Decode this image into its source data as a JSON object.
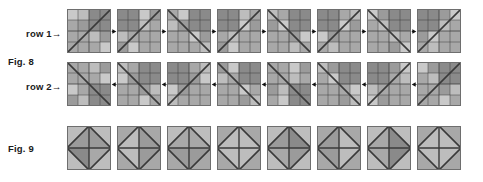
{
  "figure": {
    "background_color": "#ffffff",
    "ink_color": "#1a1a1a",
    "width": 483,
    "height": 182
  },
  "labels": {
    "row1": "row 1→",
    "fig8": "Fig. 8",
    "row2": "row 2→",
    "fig9": "Fig. 9"
  },
  "palette": {
    "light": "#c9c9c9",
    "light2": "#bdbdbd",
    "mid": "#a8a8a8",
    "mid2": "#9b9b9b",
    "dark": "#8a8a8a",
    "dark2": "#7d7d7d",
    "line": "#3a3a3a",
    "tile_border": "#6e6e6e",
    "arrow": "#111111"
  },
  "fig8": {
    "caption": "Fig. 8",
    "tile_size": 44,
    "tile_pitch": 50,
    "rows": [
      {
        "name": "row 1",
        "label": "row 1→",
        "arrow_direction": "right",
        "arrow_glyph": "▶",
        "tiles": [
          {
            "diagonal": "anti",
            "quads": [
              [
                "light",
                "mid"
              ],
              [
                "mid2",
                "light2"
              ]
            ],
            "q_tl": [
              "light",
              "light2",
              "mid",
              "mid2"
            ],
            "q_tr": [
              "dark",
              "dark",
              "dark",
              "dark"
            ],
            "q_bl": [
              "mid",
              "mid",
              "mid",
              "mid"
            ],
            "q_br": [
              "light2",
              "mid2",
              "mid",
              "light"
            ]
          },
          {
            "diagonal": "anti",
            "quads": [
              [
                "mid",
                "light"
              ],
              [
                "light2",
                "mid2"
              ]
            ],
            "q_tl": [
              "dark",
              "dark",
              "dark",
              "dark"
            ],
            "q_tr": [
              "light",
              "mid2",
              "light2",
              "mid"
            ],
            "q_bl": [
              "light2",
              "mid",
              "mid2",
              "light"
            ],
            "q_br": [
              "mid",
              "mid",
              "mid",
              "mid"
            ]
          },
          {
            "diagonal": "main",
            "quads": [
              [
                "light2",
                "mid"
              ],
              [
                "mid",
                "light"
              ]
            ],
            "q_tl": [
              "mid",
              "light",
              "light2",
              "mid2"
            ],
            "q_tr": [
              "dark",
              "dark",
              "dark",
              "dark"
            ],
            "q_bl": [
              "mid",
              "mid",
              "mid",
              "mid"
            ],
            "q_br": [
              "light",
              "mid2",
              "mid",
              "light2"
            ]
          },
          {
            "diagonal": "anti",
            "quads": [
              [
                "mid2",
                "light2"
              ],
              [
                "light",
                "mid"
              ]
            ],
            "q_tl": [
              "dark",
              "dark",
              "dark",
              "dark"
            ],
            "q_tr": [
              "light2",
              "mid",
              "light",
              "mid2"
            ],
            "q_bl": [
              "mid",
              "light2",
              "mid2",
              "light"
            ],
            "q_br": [
              "mid",
              "mid",
              "mid",
              "mid"
            ]
          },
          {
            "diagonal": "main",
            "quads": [
              [
                "light",
                "mid2"
              ],
              [
                "mid2",
                "light2"
              ]
            ],
            "q_tl": [
              "light2",
              "mid",
              "mid2",
              "light"
            ],
            "q_tr": [
              "dark",
              "dark",
              "dark",
              "dark"
            ],
            "q_bl": [
              "mid",
              "mid",
              "mid",
              "mid"
            ],
            "q_br": [
              "mid2",
              "light",
              "light2",
              "mid"
            ]
          },
          {
            "diagonal": "anti",
            "quads": [
              [
                "mid",
                "light"
              ],
              [
                "light2",
                "mid"
              ]
            ],
            "q_tl": [
              "dark",
              "dark",
              "dark",
              "dark"
            ],
            "q_tr": [
              "mid",
              "light2",
              "light",
              "mid2"
            ],
            "q_bl": [
              "light",
              "mid2",
              "mid",
              "light2"
            ],
            "q_br": [
              "mid",
              "mid",
              "mid",
              "mid"
            ]
          },
          {
            "diagonal": "main",
            "quads": [
              [
                "mid2",
                "light2"
              ],
              [
                "light",
                "mid"
              ]
            ],
            "q_tl": [
              "light",
              "mid2",
              "mid",
              "light2"
            ],
            "q_tr": [
              "dark",
              "dark",
              "dark",
              "dark"
            ],
            "q_bl": [
              "mid",
              "mid",
              "mid",
              "mid"
            ],
            "q_br": [
              "light2",
              "mid",
              "mid2",
              "light"
            ]
          },
          {
            "diagonal": "anti",
            "quads": [
              [
                "light2",
                "mid"
              ],
              [
                "mid2",
                "light"
              ]
            ],
            "q_tl": [
              "dark",
              "dark",
              "dark",
              "dark"
            ],
            "q_tr": [
              "mid2",
              "light",
              "light2",
              "mid"
            ],
            "q_bl": [
              "mid2",
              "light",
              "mid",
              "light2"
            ],
            "q_br": [
              "mid",
              "mid",
              "mid",
              "mid"
            ]
          }
        ]
      },
      {
        "name": "row 2",
        "label": "row 2→",
        "arrow_direction": "left",
        "arrow_glyph": "◀",
        "tiles": [
          {
            "diagonal": "main",
            "q_tl": [
              "mid",
              "mid",
              "mid",
              "mid"
            ],
            "q_tr": [
              "light2",
              "mid2",
              "mid",
              "light"
            ],
            "q_bl": [
              "light",
              "mid",
              "mid2",
              "light2"
            ],
            "q_br": [
              "dark",
              "dark",
              "dark",
              "dark"
            ]
          },
          {
            "diagonal": "main",
            "q_tl": [
              "light2",
              "mid",
              "light",
              "mid2"
            ],
            "q_tr": [
              "dark",
              "dark",
              "dark",
              "dark"
            ],
            "q_bl": [
              "mid",
              "mid",
              "mid",
              "mid"
            ],
            "q_br": [
              "mid2",
              "light2",
              "light",
              "mid"
            ]
          },
          {
            "diagonal": "anti",
            "q_tl": [
              "dark",
              "dark",
              "dark",
              "dark"
            ],
            "q_tr": [
              "mid",
              "light2",
              "mid2",
              "light"
            ],
            "q_bl": [
              "light",
              "mid2",
              "light2",
              "mid"
            ],
            "q_br": [
              "mid",
              "mid",
              "mid",
              "mid"
            ]
          },
          {
            "diagonal": "main",
            "q_tl": [
              "mid2",
              "light",
              "light2",
              "mid"
            ],
            "q_tr": [
              "dark",
              "dark",
              "dark",
              "dark"
            ],
            "q_bl": [
              "mid",
              "mid",
              "mid",
              "mid"
            ],
            "q_br": [
              "light",
              "mid",
              "mid2",
              "light2"
            ]
          },
          {
            "diagonal": "main",
            "q_tl": [
              "mid",
              "mid",
              "mid",
              "mid"
            ],
            "q_tr": [
              "light",
              "mid2",
              "light2",
              "mid"
            ],
            "q_bl": [
              "mid2",
              "light2",
              "mid",
              "light"
            ],
            "q_br": [
              "dark",
              "dark",
              "dark",
              "dark"
            ]
          },
          {
            "diagonal": "main",
            "q_tl": [
              "light2",
              "mid2",
              "mid",
              "light"
            ],
            "q_tr": [
              "dark",
              "dark",
              "dark",
              "dark"
            ],
            "q_bl": [
              "mid",
              "mid",
              "mid",
              "mid"
            ],
            "q_br": [
              "mid",
              "light",
              "mid2",
              "light2"
            ]
          },
          {
            "diagonal": "anti",
            "q_tl": [
              "dark",
              "dark",
              "dark",
              "dark"
            ],
            "q_tr": [
              "mid2",
              "light",
              "mid",
              "light2"
            ],
            "q_bl": [
              "light2",
              "mid",
              "light",
              "mid2"
            ],
            "q_br": [
              "mid",
              "mid",
              "mid",
              "mid"
            ]
          },
          {
            "diagonal": "anti",
            "q_tl": [
              "light",
              "mid2",
              "mid",
              "light2"
            ],
            "q_tr": [
              "dark",
              "dark",
              "dark",
              "dark"
            ],
            "q_bl": [
              "mid",
              "mid",
              "mid",
              "mid"
            ],
            "q_br": [
              "mid2",
              "light2",
              "light",
              "mid"
            ]
          }
        ]
      }
    ]
  },
  "fig9": {
    "caption": "Fig. 9",
    "tile_size": 44,
    "tile_pitch": 50,
    "tiles": [
      {
        "corners": [
          "light2",
          "light2",
          "light2",
          "light2"
        ],
        "diamond": [
          "mid2",
          "mid",
          "dark",
          "mid2"
        ]
      },
      {
        "corners": [
          "mid",
          "mid",
          "mid",
          "mid"
        ],
        "diamond": [
          "mid2",
          "mid2",
          "light2",
          "light2"
        ]
      },
      {
        "corners": [
          "light2",
          "light2",
          "mid",
          "mid"
        ],
        "diamond": [
          "mid",
          "mid2",
          "mid2",
          "mid"
        ]
      },
      {
        "corners": [
          "mid",
          "mid",
          "mid",
          "mid"
        ],
        "diamond": [
          "light2",
          "light2",
          "light2",
          "light2"
        ]
      },
      {
        "corners": [
          "light2",
          "light2",
          "light2",
          "light2"
        ],
        "diamond": [
          "dark",
          "mid2",
          "mid",
          "mid2"
        ]
      },
      {
        "corners": [
          "mid",
          "mid",
          "mid",
          "mid"
        ],
        "diamond": [
          "light2",
          "light2",
          "mid2",
          "mid2"
        ]
      },
      {
        "corners": [
          "light2",
          "light2",
          "light2",
          "light2"
        ],
        "diamond": [
          "dark",
          "dark",
          "mid",
          "mid"
        ]
      },
      {
        "corners": [
          "mid",
          "mid",
          "mid",
          "mid"
        ],
        "diamond": [
          "light2",
          "light2",
          "light2",
          "light2"
        ]
      }
    ]
  }
}
